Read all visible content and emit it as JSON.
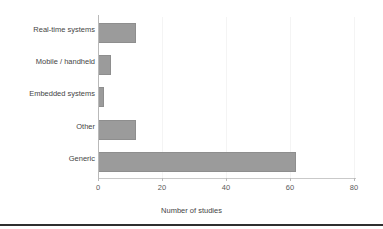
{
  "chart_data": {
    "type": "bar",
    "orientation": "horizontal",
    "title": "",
    "xlabel": "Number of studies",
    "ylabel": "",
    "categories": [
      "Real-time systems",
      "Mobile / handheld",
      "Embedded systems",
      "Other",
      "Generic"
    ],
    "values": [
      12,
      4,
      2,
      12,
      62
    ],
    "xlim": [
      0,
      80.6
    ],
    "xticks": [
      0,
      20,
      40,
      60,
      80
    ],
    "xtick_labels": [
      "0",
      "20",
      "40",
      "60",
      "80"
    ],
    "grid": true,
    "grid_axis": "x",
    "legend": false,
    "bar_color": "#9b9b9b",
    "bar_edge_color": "#8e8e8e",
    "axis_color": "#b9b9b9",
    "background": "#ffffff"
  },
  "axis": {
    "x_title": "Number of studies",
    "ticks": [
      {
        "label": "0",
        "value": 0
      },
      {
        "label": "20",
        "value": 20
      },
      {
        "label": "40",
        "value": 40
      },
      {
        "label": "60",
        "value": 60
      },
      {
        "label": "80",
        "value": 80
      }
    ]
  },
  "bars": [
    {
      "label": "Real-time systems",
      "value": 12
    },
    {
      "label": "Mobile / handheld",
      "value": 4
    },
    {
      "label": "Embedded systems",
      "value": 2
    },
    {
      "label": "Other",
      "value": 12
    },
    {
      "label": "Generic",
      "value": 62
    }
  ]
}
